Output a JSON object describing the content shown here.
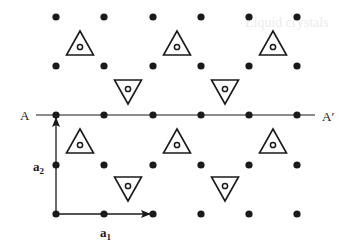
{
  "figure": {
    "labels": {
      "line_start": "A",
      "line_end": "A′",
      "vector_a1": "a",
      "vector_a1_sub": "1",
      "vector_a2": "a",
      "vector_a2_sub": "2"
    },
    "background_heading": "Liquid crystals",
    "colors": {
      "ink": "#1a1a1a",
      "background": "#ffffff",
      "bleed_text": "#ececec"
    },
    "lattice": {
      "columns_x": [
        56,
        104,
        153,
        201,
        249,
        297
      ],
      "rows_y": [
        17,
        66,
        115,
        165,
        214
      ],
      "dot_radius": 3.6
    },
    "triangles_up": [
      {
        "x": 80,
        "y": 45
      },
      {
        "x": 177,
        "y": 45
      },
      {
        "x": 273,
        "y": 45
      },
      {
        "x": 80,
        "y": 143
      },
      {
        "x": 177,
        "y": 143
      },
      {
        "x": 273,
        "y": 143
      }
    ],
    "triangles_down": [
      {
        "x": 128,
        "y": 90
      },
      {
        "x": 225,
        "y": 90
      },
      {
        "x": 128,
        "y": 187
      },
      {
        "x": 225,
        "y": 187
      }
    ],
    "mirror_line": {
      "y": 115,
      "x_start": 36,
      "x_end": 315
    },
    "vectors": {
      "origin": {
        "x": 56,
        "y": 214
      },
      "a1_tip": {
        "x": 153,
        "y": 214
      },
      "a2_tip": {
        "x": 56,
        "y": 115
      }
    }
  }
}
